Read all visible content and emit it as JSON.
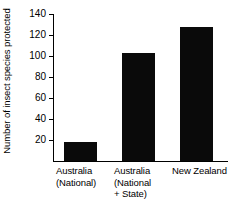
{
  "chart_data": {
    "type": "bar",
    "title": "",
    "xlabel": "",
    "ylabel": "Number of insect species protected",
    "categories": [
      "Australia\n(National)",
      "Australia\n(National\n+ State)",
      "New Zealand"
    ],
    "values": [
      18,
      103,
      128
    ],
    "ylim": [
      0,
      140
    ],
    "yticks": [
      20,
      40,
      60,
      80,
      100,
      120,
      140
    ],
    "ytick_labels": [
      "20",
      "40",
      "60",
      "80",
      "100",
      "120",
      "140"
    ],
    "grid": false,
    "legend": null,
    "bar_color": "#0a0a0a",
    "axis_color": "#000000",
    "background": "#ffffff"
  }
}
